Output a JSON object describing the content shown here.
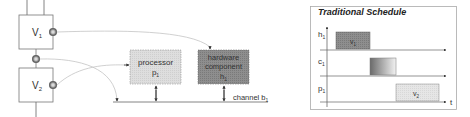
{
  "architecture": {
    "tasks": [
      {
        "id": "v1",
        "label": "V",
        "sub": "1"
      },
      {
        "id": "v2",
        "label": "V",
        "sub": "2"
      }
    ],
    "processor": {
      "line1": "processor",
      "line2": "p",
      "sub": "1"
    },
    "hardware": {
      "line1": "hardware",
      "line2": "component",
      "line3": "h",
      "sub": "1"
    },
    "channel": {
      "label": "channel b",
      "sub": "1"
    }
  },
  "schedule": {
    "title": "Traditional Schedule",
    "rows": [
      {
        "label": "h",
        "sub": "1"
      },
      {
        "label": "c",
        "sub": "1"
      },
      {
        "label": "p",
        "sub": "1"
      }
    ],
    "blocks": [
      {
        "row": "h1",
        "label": "v",
        "sub": "1",
        "fill": "#8a8a8a"
      },
      {
        "row": "c1",
        "label": "",
        "sub": "",
        "fill": "gradient"
      },
      {
        "row": "p1",
        "label": "v",
        "sub": "2",
        "fill": "#e4e4e4"
      }
    ],
    "time_axis_label": "t"
  },
  "colors": {
    "processor_fill": "#dcdcdc",
    "hardware_fill": "#8c8c8c",
    "line": "#555555",
    "curve": "#bbbbbb"
  }
}
